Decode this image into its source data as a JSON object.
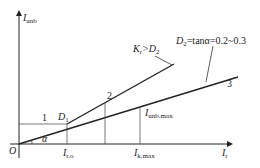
{
  "axes": {
    "y_label": "I",
    "y_sub": "unb",
    "x_label": "I",
    "x_sub": "r",
    "origin": "O"
  },
  "labels": {
    "point1": "1",
    "point2": "2",
    "point3": "3",
    "d1": "D",
    "d1_sub": "1",
    "alpha": "α",
    "i_r0": "I",
    "i_r0_sub": "r.o",
    "i_kmax": "I",
    "i_kmax_sub": "k.max",
    "i_unbmax": "I",
    "i_unbmax_sub": "unb.max",
    "k_label": "K",
    "k_sub": "r",
    "k_rel": ">D",
    "k_rel_sub": "2",
    "d2_label": "D",
    "d2_sub": "2",
    "d2_eq": "=tanα=0.2~0.3"
  },
  "colors": {
    "line": "#222222"
  }
}
